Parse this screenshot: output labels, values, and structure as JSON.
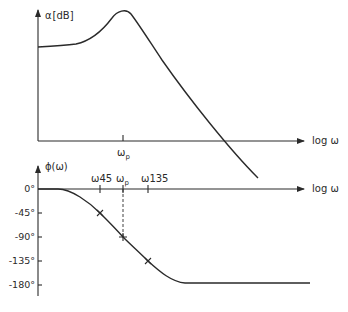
{
  "figure": {
    "upper_plot": {
      "y_label_main": "α",
      "y_label_unit": "[dB]",
      "x_label": "log ω",
      "x_tick_labels": [
        {
          "main": "ω",
          "sub": "p"
        }
      ],
      "description": "Attenuation magnitude vs log frequency with resonance peak at ω_p"
    },
    "lower_plot": {
      "y_label": "ϕ(ω)",
      "x_label": "log ω",
      "y_tick_labels": [
        "0°",
        "-45°",
        "-90°",
        "-135°",
        "-180°"
      ],
      "x_tick_labels": [
        {
          "main": "ω",
          "sub": "45"
        },
        {
          "main": "ω",
          "sub": "p"
        },
        {
          "main": "ω",
          "sub": "135"
        }
      ],
      "description": "Phase vs log frequency falling from 0° to -180°, passing -45° at ω45, -90° at ωp, -135° at ω135"
    },
    "colors": {
      "ink": "#2a2a2a",
      "background": "#ffffff"
    }
  }
}
